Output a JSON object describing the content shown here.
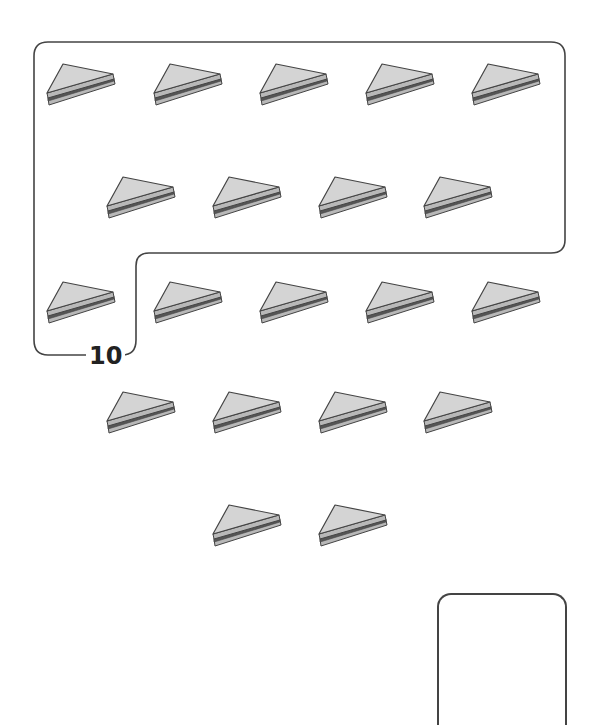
{
  "worksheet": {
    "group_label": "10",
    "answer_box_value": "",
    "colors": {
      "outline": "#444444",
      "bread_fill": "#d4d4d4",
      "crust_fill": "#b8b8b8",
      "filling": "#555555"
    },
    "rows": [
      {
        "y": 62,
        "xs": [
          45,
          152,
          258,
          364,
          470
        ]
      },
      {
        "y": 175,
        "xs": [
          105,
          211,
          317,
          422
        ]
      },
      {
        "y": 280,
        "xs": [
          45,
          152,
          258,
          364,
          470
        ]
      },
      {
        "y": 390,
        "xs": [
          105,
          211,
          317,
          422
        ]
      },
      {
        "y": 503,
        "xs": [
          211,
          317
        ]
      }
    ],
    "total_sandwiches": 20,
    "grouped_sandwiches": 10
  }
}
